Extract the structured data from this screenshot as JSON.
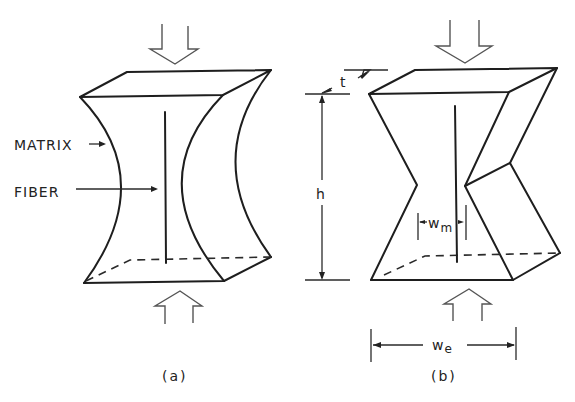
{
  "figure": {
    "panel_a": {
      "caption": "(a)",
      "labels": {
        "matrix": "MATRIX",
        "fiber": "FIBER"
      },
      "description": "Rectangular prism with concave curved sides under compression; central vertical fiber"
    },
    "panel_b": {
      "caption": "(b)",
      "dimensions": {
        "thickness": "t",
        "height": "h",
        "matrix_width": "w",
        "matrix_width_sub": "m",
        "element_width": "w",
        "element_width_sub": "e"
      },
      "description": "Rectangular prism with V-notched (kinked) sides under compression; central vertical fiber"
    },
    "load_arrows": [
      "top-down compression arrow",
      "bottom-up compression arrow"
    ],
    "colors": {
      "line": "#1e1e1e",
      "arrow_outline": "#555555",
      "background": "#ffffff"
    }
  }
}
